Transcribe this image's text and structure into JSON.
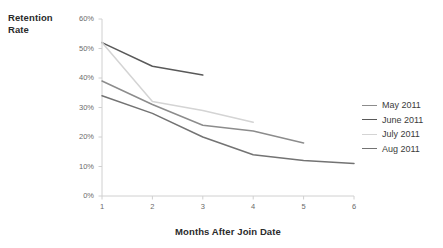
{
  "chart_data": {
    "type": "line",
    "title": "",
    "xlabel": "Months After Join Date",
    "ylabel": "Retention Rate",
    "ylabel_lines": [
      "Retention",
      "Rate"
    ],
    "x": [
      1,
      2,
      3,
      4,
      5,
      6
    ],
    "xlim": [
      1,
      6
    ],
    "ylim": [
      0,
      60
    ],
    "grid": false,
    "legend_position": "right",
    "x_tick_labels": [
      "1",
      "2",
      "3",
      "4",
      "5",
      "6"
    ],
    "y_tick_labels": [
      "0%",
      "10%",
      "20%",
      "30%",
      "40%",
      "50%",
      "60%"
    ],
    "y_tick_values": [
      0,
      10,
      20,
      30,
      40,
      50,
      60
    ],
    "series": [
      {
        "name": "May 2011",
        "color": "#8c8c8c",
        "x": [
          1,
          2,
          3,
          4,
          5
        ],
        "values": [
          39,
          31,
          24,
          22,
          18
        ]
      },
      {
        "name": "June 2011",
        "color": "#595959",
        "x": [
          1,
          2,
          3
        ],
        "values": [
          52,
          44,
          41
        ]
      },
      {
        "name": "July 2011",
        "color": "#d4d4d4",
        "x": [
          1,
          2,
          3,
          4
        ],
        "values": [
          52,
          32,
          29,
          25
        ]
      },
      {
        "name": "Aug 2011",
        "color": "#737373",
        "x": [
          1,
          2,
          3,
          4,
          5,
          6
        ],
        "values": [
          34,
          28,
          20,
          14,
          12,
          11
        ]
      }
    ]
  },
  "axis_colors": {
    "axis_line": "#d0d0d0",
    "tick_label": "#6b6b6b",
    "title": "#2b2b2b"
  }
}
